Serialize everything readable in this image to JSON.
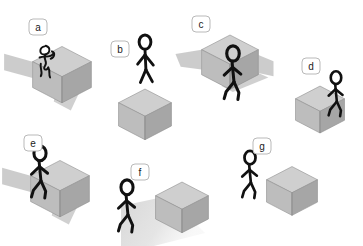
{
  "figure": {
    "background_color": "#ffffff",
    "panel_count": 7,
    "ink_color": "#111111",
    "badge": {
      "fill": "#ffffff",
      "stroke": "#b9b9b9",
      "text_color": "#1b1b1b",
      "shape": "rounded-rectangle"
    },
    "cube_colors": {
      "top_face": "#cfcfcf",
      "left_face": "#bdbdbd",
      "right_face": "#a6a6a6",
      "edge": "#8f8f8f",
      "shadow_plane": "#c8c8c8",
      "ground_shadow": "#d8d8d8"
    }
  },
  "panels": [
    {
      "id": "a",
      "label": "a",
      "badge": {
        "x": 38,
        "y": 27
      },
      "description": "figure tangled in front of cube with shadow plane to the left",
      "cube": {
        "cx": 62,
        "cy": 62,
        "size": 30
      },
      "has_shadow_plane": true,
      "has_ground_shadow": false,
      "person_pose": "tangled-scribble",
      "person": {
        "x": 47,
        "y": 60,
        "scale": 0.62
      }
    },
    {
      "id": "b",
      "label": "b",
      "badge": {
        "x": 120,
        "y": 49
      },
      "description": "figure standing on top of cube",
      "cube": {
        "cx": 145,
        "cy": 103,
        "size": 27
      },
      "has_shadow_plane": false,
      "has_ground_shadow": false,
      "person_pose": "standing-on-top",
      "person": {
        "x": 145,
        "y": 66,
        "scale": 0.92
      }
    },
    {
      "id": "c",
      "label": "c",
      "badge": {
        "x": 201,
        "y": 24
      },
      "description": "figure standing below a raised cube with shadow plane behind",
      "cube": {
        "cx": 230,
        "cy": 50,
        "size": 29
      },
      "has_shadow_plane": true,
      "has_ground_shadow": false,
      "person_pose": "walking",
      "person": {
        "x": 233,
        "y": 79,
        "scale": 0.98
      }
    },
    {
      "id": "d",
      "label": "d",
      "badge": {
        "x": 311,
        "y": 66
      },
      "description": "figure standing in front of the right face of the cube",
      "cube": {
        "cx": 320,
        "cy": 99,
        "size": 25
      },
      "has_shadow_plane": false,
      "has_ground_shadow": false,
      "person_pose": "walking",
      "person": {
        "x": 336,
        "y": 99,
        "scale": 0.82
      }
    },
    {
      "id": "e",
      "label": "e",
      "badge": {
        "x": 33,
        "y": 143
      },
      "description": "figure walking in front of cube with shadow plane to the left",
      "cube": {
        "cx": 60,
        "cy": 176,
        "size": 30
      },
      "has_shadow_plane": true,
      "has_ground_shadow": false,
      "person_pose": "walking",
      "person": {
        "x": 40,
        "y": 178,
        "scale": 0.95
      }
    },
    {
      "id": "f",
      "label": "f",
      "badge": {
        "x": 140,
        "y": 172
      },
      "description": "figure at left and cube at right joined by a soft ground shadow",
      "cube": {
        "cx": 182,
        "cy": 196,
        "size": 27
      },
      "has_shadow_plane": false,
      "has_ground_shadow": true,
      "person_pose": "walking",
      "person": {
        "x": 127,
        "y": 212,
        "scale": 0.95
      }
    },
    {
      "id": "g",
      "label": "g",
      "badge": {
        "x": 262,
        "y": 146
      },
      "description": "figure at left standing apart from the cube at right",
      "cube": {
        "cx": 292,
        "cy": 180,
        "size": 26
      },
      "has_shadow_plane": false,
      "has_ground_shadow": false,
      "person_pose": "walking",
      "person": {
        "x": 250,
        "y": 180,
        "scale": 0.86
      }
    }
  ]
}
